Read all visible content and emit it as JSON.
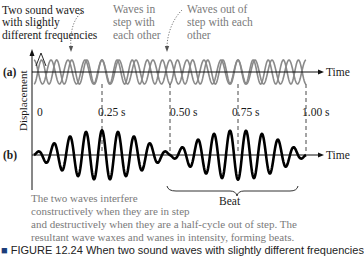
{
  "figure": {
    "annotations": {
      "two_waves": [
        "Two sound waves",
        "with slightly",
        "different frequencies"
      ],
      "in_step": [
        "Waves in",
        "step with",
        "each other"
      ],
      "out_of_step": [
        "Waves out of",
        "step with each",
        "other"
      ]
    },
    "panel_labels": {
      "a": "(a)",
      "b": "(b)"
    },
    "axis": {
      "y_label": "Displacement",
      "x_label": "Time",
      "origin_label": "0"
    },
    "time_markers": [
      "0.25 s",
      "0.50 s",
      "0.75 s",
      "1.00 s"
    ],
    "beat_label": "Beat",
    "explanation": [
      "The two waves interfere",
      "constructively when they are in step",
      "and destructively when they are a half-cycle out of step.  The",
      "resultant wave waxes and wanes in intensity, forming beats."
    ],
    "caption_partial": "FIGURE 12.24  When two sound waves with slightly different frequencies",
    "colors": {
      "component_wave": "#8a8a8a",
      "resultant_wave": "#000000",
      "annotation_text": "#7a7a7a",
      "body_text": "#1a1a1a"
    }
  }
}
